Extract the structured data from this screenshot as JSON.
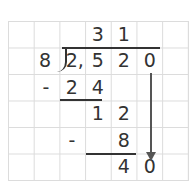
{
  "problem": {
    "divisor": "8",
    "dividend_digits": [
      "2,",
      "5",
      "2",
      "0"
    ],
    "quotient_digits": [
      "3",
      "1"
    ]
  },
  "steps": [
    {
      "op": "-",
      "digits": [
        "2",
        "4"
      ]
    },
    {
      "digits": [
        "1",
        "2"
      ]
    },
    {
      "op": "-",
      "digits": [
        "8"
      ]
    },
    {
      "digits": [
        "4",
        "0"
      ]
    }
  ],
  "colors": {
    "ink": "#333333",
    "grid": "#dcdcdc",
    "arrow": "#555555"
  }
}
